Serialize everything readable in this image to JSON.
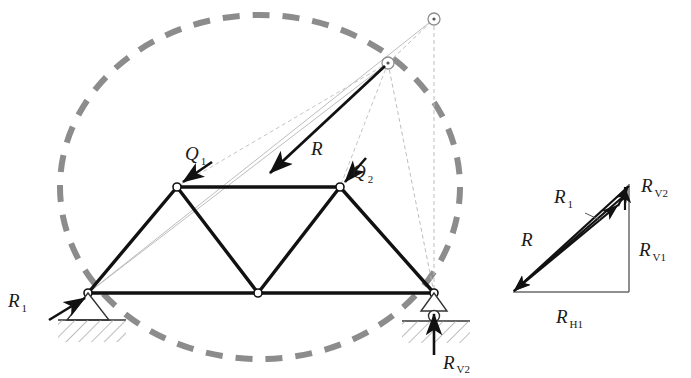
{
  "figure": {
    "colors": {
      "member": "#1a1a1a",
      "construction_line": "#b9b9b9",
      "dashed_circle": "#8c8c8c",
      "hatch": "#9a9a9a",
      "label": "#1a1a1a",
      "node_fill": "#ffffff",
      "background": "#ffffff"
    }
  },
  "truss": {
    "nodes": [
      {
        "id": "A",
        "name": "left-support-node",
        "x": 88,
        "y": 293
      },
      {
        "id": "B",
        "name": "bottom-mid-node",
        "x": 258,
        "y": 293
      },
      {
        "id": "C",
        "name": "right-support-node",
        "x": 434,
        "y": 293
      },
      {
        "id": "D",
        "name": "top-left-node",
        "x": 177,
        "y": 187
      },
      {
        "id": "E",
        "name": "top-right-node",
        "x": 340,
        "y": 187
      }
    ],
    "members": [
      {
        "from": "A",
        "to": "B",
        "name": "bottom-chord-left"
      },
      {
        "from": "B",
        "to": "C",
        "name": "bottom-chord-right"
      },
      {
        "from": "D",
        "to": "E",
        "name": "top-chord"
      },
      {
        "from": "A",
        "to": "D",
        "name": "diagonal-a-d"
      },
      {
        "from": "D",
        "to": "B",
        "name": "diagonal-d-b"
      },
      {
        "from": "B",
        "to": "E",
        "name": "diagonal-b-e"
      },
      {
        "from": "E",
        "to": "C",
        "name": "diagonal-e-c"
      }
    ]
  },
  "construction": {
    "convergence_point": {
      "name": "resultant-convergence-point",
      "x": 388,
      "y": 63
    },
    "upper_point": {
      "name": "upper-intersection-point",
      "x": 434,
      "y": 19
    },
    "circle": {
      "cx": 260,
      "cy": 187,
      "rx": 200,
      "ry": 172
    }
  },
  "forces": {
    "q1": {
      "label": "Q",
      "subscript": "1",
      "name": "load-q1",
      "tail": {
        "x": 212,
        "y": 162
      },
      "head": {
        "x": 181,
        "y": 183
      }
    },
    "q2": {
      "label": "Q",
      "subscript": "2",
      "name": "load-q2",
      "tail": {
        "x": 366,
        "y": 158
      },
      "head": {
        "x": 344,
        "y": 183
      }
    },
    "r": {
      "label": "R",
      "subscript": "",
      "name": "resultant-force-r",
      "tail": {
        "x": 385,
        "y": 66
      },
      "head": {
        "x": 266,
        "y": 176
      }
    },
    "r1": {
      "label": "R",
      "subscript": "1",
      "name": "reaction-r1",
      "tail": {
        "x": 49,
        "y": 320
      },
      "head": {
        "x": 88,
        "y": 296
      }
    },
    "rv2": {
      "label": "R",
      "subscript": "V2",
      "name": "reaction-rv2",
      "tail": {
        "x": 434,
        "y": 355
      },
      "head": {
        "x": 434,
        "y": 311
      }
    }
  },
  "supports": {
    "left": {
      "name": "pin-support-left",
      "type": "pin",
      "apex": {
        "x": 88,
        "y": 293
      },
      "base_y": 320,
      "half_width": 21,
      "hatch_x": 60,
      "hatch_width": 66,
      "hatch_height": 22
    },
    "right": {
      "name": "roller-support-right",
      "type": "roller",
      "apex": {
        "x": 434,
        "y": 293
      },
      "base_y": 313,
      "half_width": 14,
      "roller_r": 5.5,
      "ground_y": 320,
      "hatch_x": 404,
      "hatch_width": 64,
      "hatch_height": 22
    }
  },
  "force_polygon": {
    "name": "force-polygon",
    "origin": {
      "x": 513,
      "y": 292
    },
    "apex": {
      "x": 629,
      "y": 184
    },
    "corner": {
      "x": 629,
      "y": 292
    },
    "mid_break": {
      "x": 619,
      "y": 207
    },
    "inner_apex": {
      "x": 625,
      "y": 193
    },
    "labels": [
      {
        "name": "polygon-label-r1",
        "text": "R",
        "sub": "1",
        "x": 557,
        "y": 205
      },
      {
        "name": "polygon-label-rv2",
        "text": "R",
        "sub": "V2",
        "x": 640,
        "y": 192
      },
      {
        "name": "polygon-label-r",
        "text": "R",
        "sub": "",
        "x": 524,
        "y": 243
      },
      {
        "name": "polygon-label-rv1",
        "text": "R",
        "sub": "V1",
        "x": 638,
        "y": 252
      },
      {
        "name": "polygon-label-rh1",
        "text": "R",
        "sub": "H1",
        "x": 560,
        "y": 322
      }
    ]
  },
  "labels": {
    "q1": {
      "text": "Q",
      "sub": "1",
      "x": 185,
      "y": 160
    },
    "q2": {
      "text": "Q",
      "sub": "2",
      "x": 352,
      "y": 178
    },
    "r": {
      "text": "R",
      "sub": "",
      "x": 311,
      "y": 155
    },
    "r1": {
      "text": "R",
      "sub": "1",
      "x": 8,
      "y": 307
    },
    "rv2": {
      "text": "R",
      "sub": "V2",
      "x": 443,
      "y": 367
    }
  }
}
